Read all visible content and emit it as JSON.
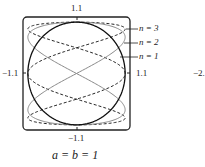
{
  "figure": {
    "top_label": "1.1",
    "bottom_label": "−1.1",
    "left_label": "−1.1",
    "right_label": "1.1",
    "side_label": "−2.",
    "caption": "a = b = 1",
    "legend": [
      {
        "label": "n = 3",
        "style": "dashed",
        "color": "#222222"
      },
      {
        "label": "n = 2",
        "style": "solid",
        "color": "#888888"
      },
      {
        "label": "n = 1",
        "style": "solid",
        "color": "#111111"
      }
    ],
    "window": {
      "xmin": -1.1,
      "xmax": 1.1,
      "ymin": -1.1,
      "ymax": 1.1
    }
  }
}
